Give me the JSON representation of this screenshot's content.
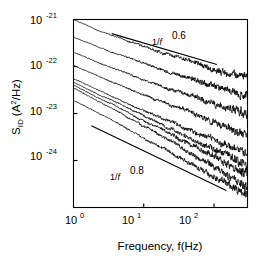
{
  "chart_data": {
    "type": "line",
    "title": "",
    "xlabel": "Frequency, f(Hz)",
    "ylabel": "S_ID (A^2/Hz)",
    "xscale": "log",
    "yscale": "log",
    "xlim": [
      1,
      300
    ],
    "ylim": [
      1e-25,
      1e-21
    ],
    "grid": false,
    "legend": "none",
    "xticks": [
      {
        "value": 1,
        "label_mantissa": "10",
        "label_exponent": "0"
      },
      {
        "value": 10,
        "label_mantissa": "10",
        "label_exponent": "1"
      },
      {
        "value": 100,
        "label_mantissa": "10",
        "label_exponent": "2"
      }
    ],
    "yticks": [
      {
        "value": 1e-21,
        "label_mantissa": "10",
        "label_exponent": "-21"
      },
      {
        "value": 1e-22,
        "label_mantissa": "10",
        "label_exponent": "-22"
      },
      {
        "value": 1e-23,
        "label_mantissa": "10",
        "label_exponent": "-23"
      },
      {
        "value": 1e-24,
        "label_mantissa": "10",
        "label_exponent": "-24"
      }
    ],
    "annotations": [
      {
        "name": "slope-guide-upper",
        "base_text": "1/",
        "italic_text": "f",
        "exponent_text": "0.6",
        "slope": -0.6,
        "x_start": 3.5,
        "y_start": 5e-22,
        "x_end": 110,
        "y_end": 1.1e-22
      },
      {
        "name": "slope-guide-lower",
        "base_text": "1/",
        "italic_text": "f",
        "exponent_text": "0.8",
        "slope": -0.8,
        "x_start": 1.8,
        "y_start": 5.5e-24,
        "x_end": 150,
        "y_end": 2.3e-25
      }
    ],
    "series": [
      {
        "name": "trace-1",
        "amplitude_at_1hz": 1e-21,
        "slope": -0.62,
        "x": [
          1,
          1.3,
          1.7,
          2.2,
          2.9,
          3.8,
          5,
          6.5,
          8.5,
          11,
          14.5,
          19,
          25,
          32,
          42,
          55,
          72,
          95,
          125,
          165,
          215,
          280
        ],
        "y": [
          1e-21,
          8.5e-22,
          7.1e-22,
          5.9e-22,
          5.2e-22,
          4.4e-22,
          3.9e-22,
          3.3e-22,
          3e-22,
          2.6e-22,
          2.2e-22,
          2e-22,
          1.75e-22,
          1.55e-22,
          1.35e-22,
          1.2e-22,
          1.05e-22,
          9.2e-23,
          8.2e-23,
          7.2e-23,
          6.4e-23,
          5.6e-23
        ]
      },
      {
        "name": "trace-2",
        "amplitude_at_1hz": 4.2e-22,
        "slope": -0.62,
        "x": [
          1,
          1.3,
          1.7,
          2.2,
          2.9,
          3.8,
          5,
          6.5,
          8.5,
          11,
          14.5,
          19,
          25,
          32,
          42,
          55,
          72,
          95,
          125,
          165,
          215,
          280
        ],
        "y": [
          4.2e-22,
          3.6e-22,
          3.1e-22,
          2.6e-22,
          2.25e-22,
          1.95e-22,
          1.7e-22,
          1.45e-22,
          1.3e-22,
          1.12e-22,
          9.8e-23,
          8.6e-23,
          7.5e-23,
          6.6e-23,
          5.8e-23,
          5.1e-23,
          4.5e-23,
          4e-23,
          3.5e-23,
          3.1e-23,
          2.75e-23,
          2.4e-23
        ]
      },
      {
        "name": "trace-3",
        "amplitude_at_1hz": 2e-22,
        "slope": -0.65,
        "x": [
          1,
          1.3,
          1.7,
          2.2,
          2.9,
          3.8,
          5,
          6.5,
          8.5,
          11,
          14.5,
          19,
          25,
          32,
          42,
          55,
          72,
          95,
          125,
          165,
          215,
          280
        ],
        "y": [
          2e-22,
          1.72e-22,
          1.46e-22,
          1.24e-22,
          1.06e-22,
          9e-23,
          7.8e-23,
          6.7e-23,
          5.8e-23,
          5e-23,
          4.3e-23,
          3.75e-23,
          3.25e-23,
          2.85e-23,
          2.45e-23,
          2.15e-23,
          1.85e-23,
          1.62e-23,
          1.42e-23,
          1.24e-23,
          1.08e-23,
          9.4e-24
        ]
      },
      {
        "name": "trace-4",
        "amplitude_at_1hz": 1.05e-22,
        "slope": -0.68,
        "x": [
          1,
          1.3,
          1.7,
          2.2,
          2.9,
          3.8,
          5,
          6.5,
          8.5,
          11,
          14.5,
          19,
          25,
          32,
          42,
          55,
          72,
          95,
          125,
          165,
          215,
          280
        ],
        "y": [
          1.05e-22,
          8.9e-23,
          7.5e-23,
          6.3e-23,
          5.3e-23,
          4.5e-23,
          3.85e-23,
          3.25e-23,
          2.8e-23,
          2.4e-23,
          2.05e-23,
          1.75e-23,
          1.5e-23,
          1.3e-23,
          1.12e-23,
          9.6e-24,
          8.2e-24,
          7.1e-24,
          6.1e-24,
          5.3e-24,
          4.5e-24,
          3.9e-24
        ]
      },
      {
        "name": "trace-5",
        "amplitude_at_1hz": 5.5e-23,
        "slope": -0.72,
        "x": [
          1,
          1.3,
          1.7,
          2.2,
          2.9,
          3.8,
          5,
          6.5,
          8.5,
          11,
          14.5,
          19,
          25,
          32,
          42,
          55,
          72,
          95,
          125,
          165,
          215,
          280
        ],
        "y": [
          5.5e-23,
          4.6e-23,
          3.85e-23,
          3.2e-23,
          2.65e-23,
          2.2e-23,
          1.85e-23,
          1.55e-23,
          1.3e-23,
          1.1e-23,
          9.2e-24,
          7.8e-24,
          6.5e-24,
          5.5e-24,
          4.6e-24,
          3.9e-24,
          3.3e-24,
          2.8e-24,
          2.35e-24,
          2e-24,
          1.68e-24,
          1.42e-24
        ]
      },
      {
        "name": "trace-6",
        "amplitude_at_1hz": 4.6e-23,
        "slope": -0.76,
        "x": [
          1,
          1.3,
          1.7,
          2.2,
          2.9,
          3.8,
          5,
          6.5,
          8.5,
          11,
          14.5,
          19,
          25,
          32,
          42,
          55,
          72,
          95,
          125,
          165,
          215,
          280
        ],
        "y": [
          4.6e-23,
          3.8e-23,
          3.15e-23,
          2.6e-23,
          2.15e-23,
          1.78e-23,
          1.47e-23,
          1.22e-23,
          1.01e-23,
          8.4e-24,
          6.9e-24,
          5.7e-24,
          4.7e-24,
          3.9e-24,
          3.2e-24,
          2.65e-24,
          2.2e-24,
          1.82e-24,
          1.5e-24,
          1.25e-24,
          1.03e-24,
          8.5e-25
        ]
      },
      {
        "name": "trace-7",
        "amplitude_at_1hz": 4e-23,
        "slope": -0.8,
        "x": [
          1,
          1.3,
          1.7,
          2.2,
          2.9,
          3.8,
          5,
          6.5,
          8.5,
          11,
          14.5,
          19,
          25,
          32,
          42,
          55,
          72,
          95,
          125,
          165,
          215,
          280
        ],
        "y": [
          4e-23,
          3.3e-23,
          2.7e-23,
          2.2e-23,
          1.8e-23,
          1.47e-23,
          1.2e-23,
          9.8e-24,
          8e-24,
          6.5e-24,
          5.3e-24,
          4.3e-24,
          3.5e-24,
          2.85e-24,
          2.3e-24,
          1.88e-24,
          1.52e-24,
          1.24e-24,
          1e-24,
          8.2e-25,
          6.6e-25,
          5.4e-25
        ]
      },
      {
        "name": "trace-8",
        "amplitude_at_1hz": 3.5e-23,
        "slope": -0.84,
        "x": [
          1,
          1.3,
          1.7,
          2.2,
          2.9,
          3.8,
          5,
          6.5,
          8.5,
          11,
          14.5,
          19,
          25,
          32,
          42,
          55,
          72,
          95,
          125,
          165,
          215,
          280
        ],
        "y": [
          3.5e-23,
          2.85e-23,
          2.3e-23,
          1.85e-23,
          1.49e-23,
          1.2e-23,
          9.6e-24,
          7.7e-24,
          6.2e-24,
          4.95e-24,
          3.95e-24,
          3.15e-24,
          2.5e-24,
          2e-24,
          1.58e-24,
          1.26e-24,
          1e-24,
          7.9e-25,
          6.2e-25,
          4.9e-25,
          3.9e-25,
          3.1e-25
        ]
      },
      {
        "name": "trace-9",
        "amplitude_at_1hz": 1.9e-23,
        "slope": -0.82,
        "x": [
          1,
          1.3,
          1.7,
          2.2,
          2.9,
          3.8,
          5,
          6.5,
          8.5,
          11,
          14.5,
          19,
          25,
          32,
          42,
          55,
          72,
          95,
          125,
          165,
          215,
          280
        ],
        "y": [
          1.9e-23,
          1.56e-23,
          1.27e-23,
          1.03e-23,
          8.3e-24,
          6.7e-24,
          5.4e-24,
          4.35e-24,
          3.5e-24,
          2.82e-24,
          2.26e-24,
          1.82e-24,
          1.45e-24,
          1.17e-24,
          9.3e-25,
          7.4e-25,
          5.9e-25,
          4.7e-25,
          3.7e-25,
          2.95e-25,
          2.35e-25,
          1.87e-25
        ]
      }
    ]
  },
  "axes": {
    "x_label_text": "Frequency, f(Hz)",
    "y_label_base": "S",
    "y_label_sub": "ID",
    "y_label_unit_open": " (A",
    "y_label_unit_sup": "2",
    "y_label_unit_close": "/Hz)"
  },
  "colors": {
    "line": "#000000",
    "background": "#ffffff",
    "axis": "#000000"
  }
}
